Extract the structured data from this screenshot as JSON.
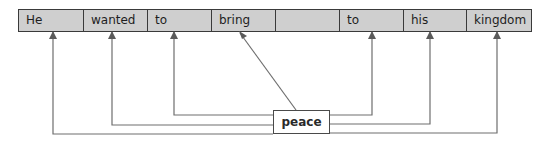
{
  "diagram": {
    "type": "word-alignment",
    "sentence_cells": [
      {
        "label": "He",
        "width": 65
      },
      {
        "label": "wanted",
        "width": 64
      },
      {
        "label": "to",
        "width": 64
      },
      {
        "label": "bring",
        "width": 64
      },
      {
        "label": "",
        "width": 64
      },
      {
        "label": "to",
        "width": 64
      },
      {
        "label": "his",
        "width": 63
      },
      {
        "label": "kingdom",
        "width": 64
      }
    ],
    "source_word": "peace",
    "arrow_targets": [
      "He",
      "wanted",
      "to",
      "bring",
      "to",
      "his",
      "kingdom"
    ],
    "colors": {
      "cell_fill": "#cfcfcf",
      "border": "#3a3a3a",
      "line": "#6e6e6e",
      "box_fill": "#ffffff"
    }
  }
}
